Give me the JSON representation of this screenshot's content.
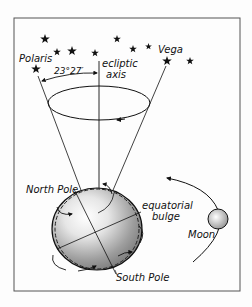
{
  "diagram": {
    "labels": {
      "polaris": "Polaris",
      "vega": "Vega",
      "ecliptic_line1": "ecliptic",
      "ecliptic_line2": "axis",
      "angle": "23°27′",
      "north_pole": "North Pole",
      "equatorial_line1": "equatorial",
      "equatorial_line2": "bulge",
      "south_pole": "South Pole",
      "moon": "Moon"
    },
    "colors": {
      "ink": "#111111",
      "earth_light": "#f4f4f4",
      "earth_dark": "#8a8a8a",
      "frame": "#555555",
      "background": "#fdfdfd"
    },
    "stars": [
      {
        "x": 45,
        "y": 39
      },
      {
        "x": 57,
        "y": 52
      },
      {
        "x": 72,
        "y": 51
      },
      {
        "x": 95,
        "y": 53
      },
      {
        "x": 117,
        "y": 39
      },
      {
        "x": 133,
        "y": 49
      },
      {
        "x": 148,
        "y": 46
      },
      {
        "x": 190,
        "y": 61
      },
      {
        "x": 36,
        "y": 69,
        "name": "Polaris"
      },
      {
        "x": 167,
        "y": 61,
        "name": "Vega"
      }
    ]
  }
}
